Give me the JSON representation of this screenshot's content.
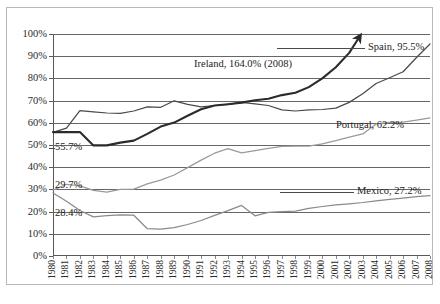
{
  "chart_data": {
    "type": "line",
    "title": "",
    "subtitle": "",
    "xlabel": "",
    "ylabel": "",
    "ylim": [
      0,
      100
    ],
    "y_unit": "%",
    "grid": true,
    "legend_position": "inline-end-labels",
    "categories": [
      "1980",
      "1981",
      "1982",
      "1983",
      "1984",
      "1985",
      "1986",
      "1987",
      "1988",
      "1989",
      "1990",
      "1991",
      "1992",
      "1993",
      "1994",
      "1995",
      "1996",
      "1997",
      "1998",
      "1999",
      "2000",
      "2001",
      "2002",
      "2003",
      "2004",
      "2005",
      "2006",
      "2007",
      "2008"
    ],
    "ytick_labels": [
      "0%",
      "10%",
      "20%",
      "30%",
      "40%",
      "50%",
      "60%",
      "70%",
      "80%",
      "90%",
      "100%"
    ],
    "ytick_values": [
      0,
      10,
      20,
      30,
      40,
      50,
      60,
      70,
      80,
      90,
      100
    ],
    "series": [
      {
        "name": "Spain",
        "color": "#4a4a4a",
        "start_label": "55.7%",
        "end_label": "Spain, 95.5%",
        "start_value": 55.7,
        "end_value": 95.5,
        "values": [
          55.7,
          57.6,
          65.5,
          64.9,
          64.4,
          64.3,
          65.3,
          67.2,
          67.0,
          69.9,
          68.3,
          67.2,
          67.8,
          68.3,
          69.2,
          68.5,
          67.8,
          65.8,
          65.3,
          65.8,
          66.0,
          66.6,
          69.2,
          73.1,
          77.7,
          80.3,
          83.0,
          89.4,
          95.5
        ]
      },
      {
        "name": "Ireland",
        "color": "#2b2b2b",
        "end_label": "Ireland, 164.0% (2008)",
        "end_value": 164.0,
        "arrow": true,
        "values": [
          55.8,
          55.8,
          55.8,
          49.8,
          49.8,
          51.1,
          52.0,
          55.0,
          58.3,
          60.1,
          63.2,
          66.1,
          67.8,
          68.4,
          69.1,
          70.2,
          70.8,
          72.5,
          73.5,
          76.1,
          80.0,
          85.0,
          91.5,
          101.0,
          114.0,
          126.0,
          139.0,
          152.0,
          164.0
        ]
      },
      {
        "name": "Portugal",
        "color": "#9a9a9a",
        "start_label": "29.7%",
        "end_label": "Portugal, 62.2%",
        "start_value": 29.7,
        "end_value": 62.2,
        "values": [
          29.7,
          32.3,
          31.6,
          29.6,
          28.8,
          30.0,
          30.1,
          32.5,
          34.2,
          36.5,
          39.8,
          43.2,
          46.3,
          48.4,
          46.5,
          47.5,
          48.5,
          49.4,
          49.5,
          49.5,
          50.5,
          52.0,
          53.5,
          55.0,
          59.5,
          60.2,
          60.3,
          61.2,
          62.2
        ]
      },
      {
        "name": "Mexico",
        "color": "#8a8a8a",
        "start_label": "28.4%",
        "end_label": "Mexico, 27.2%",
        "start_value": 28.4,
        "end_value": 27.2,
        "values": [
          28.4,
          24.7,
          20.5,
          17.6,
          18.2,
          18.5,
          18.4,
          12.3,
          12.1,
          12.8,
          14.2,
          16.0,
          18.3,
          20.4,
          22.8,
          18.1,
          19.7,
          20.0,
          20.2,
          21.5,
          22.3,
          23.0,
          23.5,
          24.1,
          24.8,
          25.5,
          26.1,
          26.7,
          27.2
        ]
      }
    ]
  }
}
